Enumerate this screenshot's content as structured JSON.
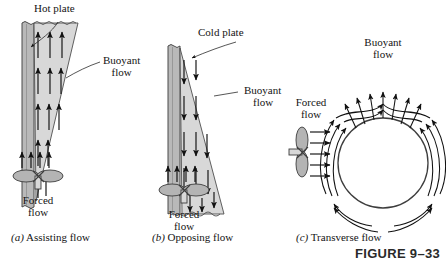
{
  "figure": {
    "number_label": "FIGURE 9–33",
    "panels": [
      {
        "id": "a",
        "caption_marker": "(a)",
        "caption_text": "Assisting flow",
        "plate_label": "Hot plate",
        "buoyant_label_line1": "Buoyant",
        "buoyant_label_line2": "flow",
        "forced_label_line1": "Forced",
        "forced_label_line2": "flow",
        "buoyant_direction": "up",
        "forced_direction": "up",
        "arrow_count_buoyant": 14,
        "arrow_count_forced": 4
      },
      {
        "id": "b",
        "caption_marker": "(b)",
        "caption_text": "Opposing flow",
        "plate_label": "Cold plate",
        "buoyant_label_line1": "Buoyant",
        "buoyant_label_line2": "flow",
        "forced_label_line1": "Forced",
        "forced_label_line2": "flow",
        "buoyant_direction": "down",
        "forced_direction": "up",
        "arrow_count_buoyant": 14,
        "arrow_count_forced": 4
      },
      {
        "id": "c",
        "caption_marker": "(c)",
        "caption_text": "Transverse flow",
        "buoyant_label_line1": "Buoyant",
        "buoyant_label_line2": "flow",
        "forced_label_line1": "Forced",
        "forced_label_line2": "flow",
        "buoyant_direction": "up",
        "forced_direction": "right",
        "arrow_count_forced": 5,
        "body_shape": "circle"
      }
    ],
    "colors": {
      "plate_fill": "#b9b9b9",
      "plate_edge": "#4a4a4a",
      "boundary_fill": "#d6d6d6",
      "arrow": "#111111",
      "fan_fill": "#b0b0b0",
      "leader": "#2b2b2b",
      "text": "#141414"
    }
  }
}
